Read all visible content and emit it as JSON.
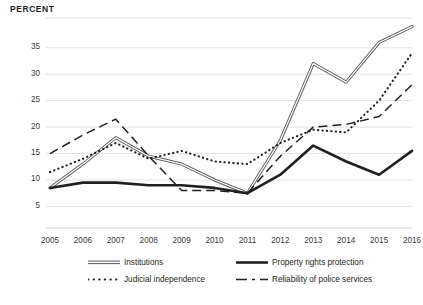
{
  "axis_title": "PERCENT",
  "legend": {
    "institutions": "Institutions",
    "property": "Property rights protection",
    "judicial": "Judicial independence",
    "police": "Reliability of police services"
  },
  "chart_data": {
    "type": "line",
    "title": "",
    "subtitle": "",
    "xlabel": "",
    "ylabel": "PERCENT",
    "grid": true,
    "legend_position": "bottom",
    "x": [
      2005,
      2006,
      2007,
      2008,
      2009,
      2010,
      2011,
      2012,
      2013,
      2014,
      2015,
      2016
    ],
    "categories": [
      "2005",
      "2006",
      "2007",
      "2008",
      "2009",
      "2010",
      "2011",
      "2012",
      "2013",
      "2014",
      "2015",
      "2016"
    ],
    "xlim": [
      2005,
      2016
    ],
    "ylim": [
      3,
      41
    ],
    "yticks": [
      5,
      10,
      15,
      20,
      25,
      30,
      35
    ],
    "ytick_labels": [
      "5",
      "10",
      "15",
      "20",
      "25",
      "30",
      "35"
    ],
    "series": [
      {
        "name": "Institutions",
        "style": "double-line",
        "color": "#58595b",
        "values": [
          8.5,
          13.0,
          18.0,
          14.5,
          13.0,
          10.0,
          7.5,
          17.5,
          32.0,
          28.5,
          36.0,
          39.0
        ]
      },
      {
        "name": "Property rights protection",
        "style": "solid-thick",
        "color": "#231f20",
        "values": [
          8.5,
          9.5,
          9.5,
          9.0,
          9.0,
          8.5,
          7.5,
          11.0,
          16.5,
          13.5,
          11.0,
          15.5
        ]
      },
      {
        "name": "Judicial independence",
        "style": "dotted",
        "color": "#231f20",
        "values": [
          11.5,
          14.0,
          17.0,
          14.0,
          15.5,
          13.5,
          13.0,
          17.0,
          19.5,
          19.0,
          25.0,
          34.0
        ]
      },
      {
        "name": "Reliability of police services",
        "style": "dashed",
        "color": "#231f20",
        "values": [
          15.0,
          18.5,
          21.5,
          14.5,
          8.0,
          8.0,
          7.5,
          14.5,
          20.0,
          20.5,
          22.0,
          28.0
        ]
      }
    ]
  }
}
